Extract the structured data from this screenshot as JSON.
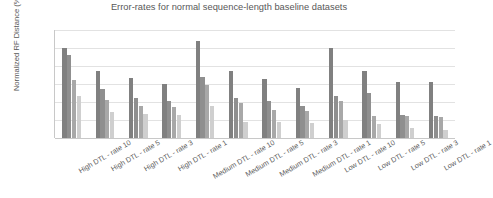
{
  "chart_data": {
    "type": "bar",
    "title": "Error-rates for normal sequence-length baseline datasets",
    "xlabel": "",
    "ylabel": "Normalized RF Distance (%)",
    "ylim": [
      0,
      12
    ],
    "yticks": [
      "0",
      "2",
      "4",
      "6",
      "8",
      "10",
      "12"
    ],
    "grid": true,
    "legend": "none",
    "categories": [
      "High DTL - rate 10",
      "High DTL - rate 5",
      "High DTL - rate 3",
      "High DTL - rate 1",
      "Medium DTL - rate 10",
      "Medium DTL - rate 5",
      "Medium DTL - rate 3",
      "Medium DTL - rate 1",
      "Low DTL - rate 10",
      "Low DTL - rate 5",
      "Low DTL - rate 3",
      "Low DTL - rate 1"
    ],
    "series": [
      {
        "name": "series-1",
        "color": "#808080",
        "values": [
          10.0,
          7.4,
          6.7,
          6.0,
          10.8,
          7.4,
          6.6,
          5.6,
          10.0,
          7.4,
          6.2,
          6.2
        ]
      },
      {
        "name": "series-2",
        "color": "#8f8f8f",
        "values": [
          9.2,
          5.5,
          4.4,
          4.1,
          6.8,
          4.5,
          4.1,
          3.6,
          4.7,
          5.0,
          2.6,
          2.5
        ]
      },
      {
        "name": "series-3",
        "color": "#a8a8a8",
        "values": [
          6.4,
          4.2,
          3.6,
          3.4,
          5.9,
          3.9,
          3.1,
          3.0,
          4.1,
          2.4,
          2.4,
          2.3
        ]
      },
      {
        "name": "series-4",
        "color": "#cfcfcf",
        "values": [
          4.7,
          2.9,
          2.7,
          2.6,
          3.6,
          1.8,
          1.8,
          1.7,
          2.0,
          1.6,
          1.1,
          0.9
        ]
      }
    ]
  },
  "axis": {
    "y_title": "Normalized RF Distance (%)"
  }
}
